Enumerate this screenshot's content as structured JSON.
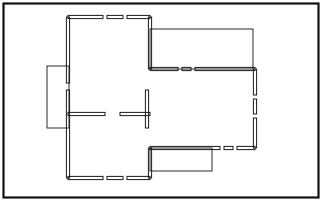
{
  "document": {
    "kind": "architectural-floor-plan",
    "title": "Floor Plan Drawing",
    "description": "Black-and-white line drawing of a residential floor plan with double-line walls, window openings, interior partitions and three single-line extensions (left, upper-right, bottom).",
    "canvas": {
      "width": 323,
      "height": 203
    },
    "colors": {
      "background": "#ffffff",
      "wall_fill": "#1a1a1a",
      "thin_stroke": "#2b2b2b",
      "frame_stroke": "#111111"
    }
  },
  "frame": {
    "label": "drawing-border",
    "x": 3.5,
    "y": 3.5,
    "width": 315,
    "height": 194,
    "stroke_width": 2.2
  },
  "geometry": {
    "wall_thickness": 3.2,
    "thin_stroke_width": 1.0,
    "outline_segments": [
      {
        "name": "top-wall-left-block",
        "orientation": "h",
        "x1": 68,
        "x2": 103,
        "y": 17
      },
      {
        "name": "top-wall-middle-block",
        "orientation": "h",
        "x1": 107,
        "x2": 123,
        "y": 17
      },
      {
        "name": "top-wall-right-block",
        "orientation": "h",
        "x1": 127,
        "x2": 150,
        "y": 17
      },
      {
        "name": "upper-left-wall-upper",
        "orientation": "v",
        "y1": 17,
        "y2": 83,
        "x": 68
      },
      {
        "name": "upper-left-wall-lower",
        "orientation": "v",
        "y1": 90,
        "y2": 178,
        "x": 68
      },
      {
        "name": "upper-right-wall",
        "orientation": "v",
        "y1": 17,
        "y2": 69,
        "x": 150
      },
      {
        "name": "mid-wall-left-block",
        "orientation": "h",
        "x1": 150,
        "x2": 178,
        "y": 69
      },
      {
        "name": "mid-wall-middle-block",
        "orientation": "h",
        "x1": 182,
        "x2": 191,
        "y": 69
      },
      {
        "name": "mid-wall-right-block",
        "orientation": "h",
        "x1": 195,
        "x2": 255,
        "y": 69
      },
      {
        "name": "right-wall-upper",
        "orientation": "v",
        "y1": 69,
        "y2": 95,
        "x": 255
      },
      {
        "name": "right-wall-middle",
        "orientation": "v",
        "y1": 99,
        "y2": 114,
        "x": 255
      },
      {
        "name": "right-wall-lower",
        "orientation": "v",
        "y1": 118,
        "y2": 148,
        "x": 255
      },
      {
        "name": "lower-wall-left-block",
        "orientation": "h",
        "x1": 150,
        "x2": 220,
        "y": 148
      },
      {
        "name": "lower-wall-middle-block",
        "orientation": "h",
        "x1": 224,
        "x2": 233,
        "y": 148
      },
      {
        "name": "lower-wall-right-block",
        "orientation": "h",
        "x1": 237,
        "x2": 255,
        "y": 148
      },
      {
        "name": "lower-left-return-wall",
        "orientation": "v",
        "y1": 148,
        "y2": 178,
        "x": 150
      },
      {
        "name": "bottom-wall-left-block",
        "orientation": "h",
        "x1": 68,
        "x2": 103,
        "y": 178
      },
      {
        "name": "bottom-wall-middle-block",
        "orientation": "h",
        "x1": 107,
        "x2": 123,
        "y": 178
      },
      {
        "name": "bottom-wall-right-block",
        "orientation": "h",
        "x1": 127,
        "x2": 150,
        "y": 178
      }
    ],
    "partition_segments": [
      {
        "name": "partition-left-stub",
        "orientation": "h",
        "x1": 68,
        "x2": 105,
        "y": 114
      },
      {
        "name": "partition-right-stub",
        "orientation": "h",
        "x1": 120,
        "x2": 150,
        "y": 114
      },
      {
        "name": "partition-vertical",
        "orientation": "v",
        "y1": 90,
        "y2": 128,
        "x": 147
      }
    ],
    "extensions": [
      {
        "name": "left-extension",
        "note": "single-line bay on the left wall",
        "x": 47,
        "y": 66,
        "width": 22,
        "height": 62
      },
      {
        "name": "upper-right-extension",
        "note": "single-line wing along the top right",
        "x": 150,
        "y": 29,
        "width": 103,
        "height": 40
      },
      {
        "name": "bottom-extension",
        "note": "single-line wing below the lower wall",
        "x": 150,
        "y": 148,
        "width": 62,
        "height": 23
      }
    ]
  }
}
